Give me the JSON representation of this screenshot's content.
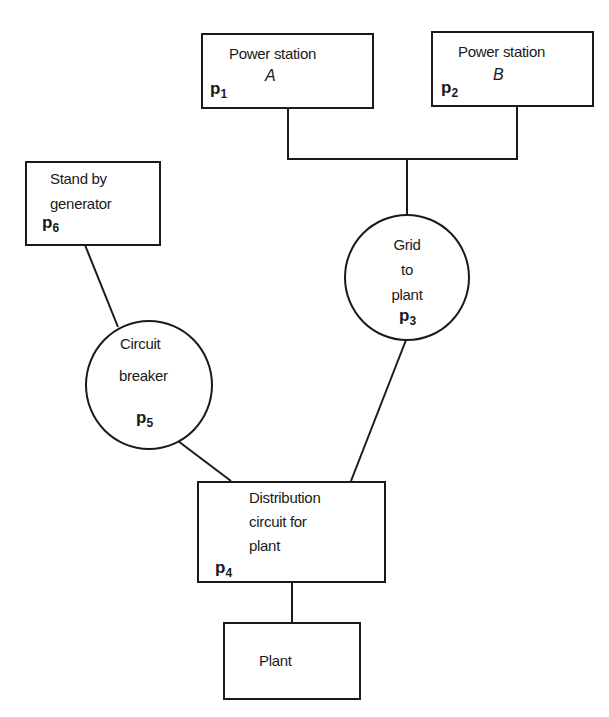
{
  "diagram": {
    "type": "reliability block / power supply network",
    "nodes": {
      "p1": {
        "shape": "rectangle",
        "label_line1": "Power station",
        "label_line2": "A",
        "id_base": "p",
        "id_sub": "1"
      },
      "p2": {
        "shape": "rectangle",
        "label_line1": "Power station",
        "label_line2": "B",
        "id_base": "p",
        "id_sub": "2"
      },
      "p3": {
        "shape": "circle",
        "label_line1": "Grid",
        "label_line2": "to",
        "label_line3": "plant",
        "id_base": "p",
        "id_sub": "3"
      },
      "p4": {
        "shape": "rectangle",
        "label_line1": "Distribution",
        "label_line2": "circuit for",
        "label_line3": "plant",
        "id_base": "p",
        "id_sub": "4"
      },
      "p5": {
        "shape": "circle",
        "label_line1": "Circuit",
        "label_line2": "breaker",
        "id_base": "p",
        "id_sub": "5"
      },
      "p6": {
        "shape": "rectangle",
        "label_line1": "Stand by",
        "label_line2": "generator",
        "id_base": "p",
        "id_sub": "6"
      },
      "plant": {
        "shape": "rectangle",
        "label": "Plant"
      }
    },
    "edges": [
      [
        "p1",
        "p3"
      ],
      [
        "p2",
        "p3"
      ],
      [
        "p6",
        "p5"
      ],
      [
        "p5",
        "p4"
      ],
      [
        "p3",
        "p4"
      ],
      [
        "p4",
        "plant"
      ]
    ],
    "colors": {
      "line": "#1a1a1a",
      "background": "#ffffff"
    }
  }
}
